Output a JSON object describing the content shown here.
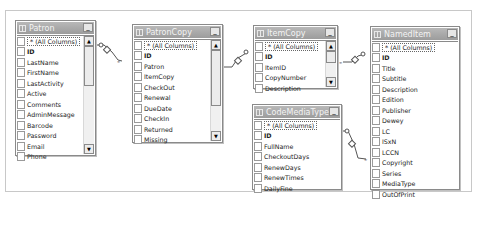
{
  "diagram": {
    "tables": [
      {
        "name": "Patron",
        "columns": [
          "* (All Columns)",
          "ID",
          "LastName",
          "FirstName",
          "LastActivity",
          "Active",
          "Comments",
          "AdminMessage",
          "Barcode",
          "Password",
          "Email",
          "Phone"
        ],
        "primary_key": "ID",
        "scrollable": true
      },
      {
        "name": "PatronCopy",
        "columns": [
          "* (All Columns)",
          "ID",
          "Patron",
          "ItemCopy",
          "CheckOut",
          "Renewal",
          "DueDate",
          "CheckIn",
          "Returned",
          "Missing"
        ],
        "primary_key": "ID",
        "scrollable": true
      },
      {
        "name": "ItemCopy",
        "columns": [
          "* (All Columns)",
          "ID",
          "ItemID",
          "CopyNumber",
          "Description"
        ],
        "primary_key": "ID",
        "scrollable": true
      },
      {
        "name": "CodeMediaType",
        "columns": [
          "* (All Columns)",
          "ID",
          "FullName",
          "CheckoutDays",
          "RenewDays",
          "RenewTimes",
          "DailyFine"
        ],
        "primary_key": "ID",
        "scrollable": false
      },
      {
        "name": "NamedItem",
        "columns": [
          "* (All Columns)",
          "ID",
          "Title",
          "Subtitle",
          "Description",
          "Edition",
          "Publisher",
          "Dewey",
          "LC",
          "ISxN",
          "LCCN",
          "Copyright",
          "Series",
          "MediaType",
          "OutOfPrint"
        ],
        "primary_key": "ID",
        "scrollable": false
      }
    ],
    "relationships": [
      {
        "from": "Patron",
        "to": "PatronCopy",
        "one_end": "Patron",
        "many_end": "PatronCopy"
      },
      {
        "from": "ItemCopy",
        "to": "PatronCopy",
        "one_end": "ItemCopy",
        "many_end": "PatronCopy"
      },
      {
        "from": "NamedItem",
        "to": "ItemCopy",
        "one_end": "NamedItem",
        "many_end": "ItemCopy"
      },
      {
        "from": "CodeMediaType",
        "to": "NamedItem",
        "one_end": "CodeMediaType",
        "many_end": "NamedItem"
      }
    ],
    "icons": {
      "table": "table-icon",
      "minimize": "minimize-icon",
      "scroll_up": "scroll-up-icon",
      "scroll_down": "scroll-down-icon",
      "key": "key-icon",
      "infinity": "infinity-icon"
    },
    "glyphs": {
      "minimize": "_",
      "scroll_up": "▲",
      "scroll_down": "▼"
    }
  }
}
